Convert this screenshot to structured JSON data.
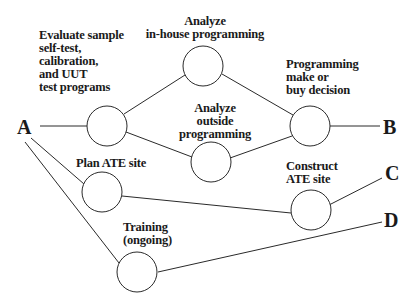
{
  "diagram": {
    "type": "activity-network",
    "terminals": {
      "A": "A",
      "B": "B",
      "C": "C",
      "D": "D"
    },
    "nodes": [
      {
        "id": "evaluate",
        "label": "Evaluate sample\nself-test,\ncalibration,\nand UUT\ntest programs"
      },
      {
        "id": "inhouse",
        "label": "Analyze\nin-house programming"
      },
      {
        "id": "outside",
        "label": "Analyze\noutside\nprogramming"
      },
      {
        "id": "makebuy",
        "label": "Programming\nmake or\nbuy decision"
      },
      {
        "id": "plan",
        "label": "Plan ATE site"
      },
      {
        "id": "construct",
        "label": "Construct\nATE site"
      },
      {
        "id": "training",
        "label": "Training\n(ongoing)"
      }
    ],
    "edges": [
      {
        "from": "A",
        "to": "evaluate"
      },
      {
        "from": "evaluate",
        "to": "inhouse"
      },
      {
        "from": "evaluate",
        "to": "outside"
      },
      {
        "from": "inhouse",
        "to": "makebuy"
      },
      {
        "from": "outside",
        "to": "makebuy"
      },
      {
        "from": "makebuy",
        "to": "B"
      },
      {
        "from": "A",
        "to": "plan"
      },
      {
        "from": "plan",
        "to": "construct"
      },
      {
        "from": "construct",
        "to": "C"
      },
      {
        "from": "A",
        "to": "training"
      },
      {
        "from": "training",
        "to": "D"
      }
    ],
    "colors": {
      "stroke": "#2a2a2a",
      "text": "#1a1a1a",
      "background": "#ffffff"
    }
  },
  "labels": {
    "evaluate": "Evaluate sample\nself-test,\ncalibration,\nand UUT\ntest programs",
    "inhouse": "Analyze\nin-house programming",
    "outside": "Analyze\noutside\nprogramming",
    "makebuy": "Programming\nmake or\nbuy decision",
    "plan": "Plan ATE site",
    "construct": "Construct\nATE site",
    "training": "Training\n(ongoing)",
    "A": "A",
    "B": "B",
    "C": "C",
    "D": "D"
  }
}
